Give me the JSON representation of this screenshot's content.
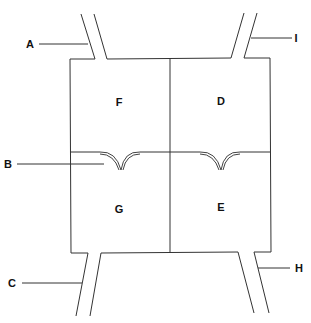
{
  "diagram": {
    "type": "heart-chamber-schematic",
    "colors": {
      "line": "#333333",
      "text": "#111111",
      "background": "#ffffff"
    },
    "chambers": [
      {
        "id": "F",
        "label": "F",
        "position": "upper-left"
      },
      {
        "id": "D",
        "label": "D",
        "position": "upper-right"
      },
      {
        "id": "G",
        "label": "G",
        "position": "lower-left"
      },
      {
        "id": "E",
        "label": "E",
        "position": "lower-right"
      }
    ],
    "pointer_labels": [
      {
        "id": "A",
        "label": "A",
        "points_to": "upper-left vessel"
      },
      {
        "id": "I",
        "label": "I",
        "points_to": "upper-right vessel"
      },
      {
        "id": "B",
        "label": "B",
        "points_to": "left valve"
      },
      {
        "id": "C",
        "label": "C",
        "points_to": "lower-left vessel"
      },
      {
        "id": "H",
        "label": "H",
        "points_to": "lower-right vessel"
      }
    ]
  }
}
